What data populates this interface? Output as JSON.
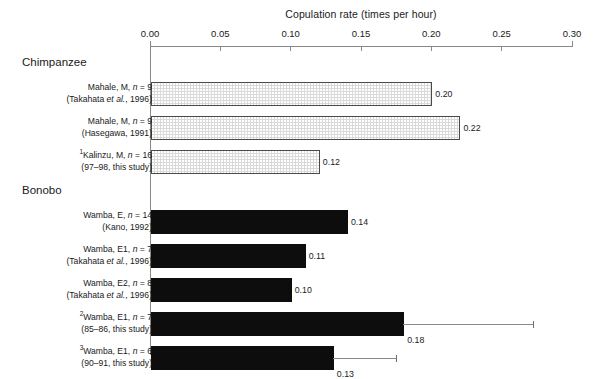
{
  "chart_data": {
    "type": "bar",
    "orientation": "horizontal",
    "title": "",
    "xlabel": "Copulation rate (times per hour)",
    "ylabel": "",
    "xlim": [
      0.0,
      0.3
    ],
    "xticks": [
      "0.00",
      "0.05",
      "0.10",
      "0.15",
      "0.20",
      "0.25",
      "0.30"
    ],
    "xtick_values": [
      0.0,
      0.05,
      0.1,
      0.15,
      0.2,
      0.25,
      0.3
    ],
    "grid": false,
    "legend": "none",
    "groups": [
      {
        "name": "Chimpanzee",
        "fill": "stippled-gray",
        "rows": [
          {
            "marker": "",
            "line1_pre": "Mahale, M, ",
            "line1_italic": "n",
            "line1_post": " = 9",
            "line2_pre": "(Takahata ",
            "line2_italic": "et al.",
            "line2_post": ", 1996)",
            "value": 0.2,
            "value_label": "0.20",
            "error_upper": null
          },
          {
            "marker": "",
            "line1_pre": "Mahale, M, ",
            "line1_italic": "n",
            "line1_post": " = 9",
            "line2_pre": "(Hasegawa, 1991)",
            "line2_italic": "",
            "line2_post": "",
            "value": 0.22,
            "value_label": "0.22",
            "error_upper": null
          },
          {
            "marker": "1",
            "line1_pre": "Kalinzu, M, ",
            "line1_italic": "n",
            "line1_post": " = 16",
            "line2_pre": "(97–98, this study)",
            "line2_italic": "",
            "line2_post": "",
            "value": 0.12,
            "value_label": "0.12",
            "error_upper": null
          }
        ]
      },
      {
        "name": "Bonobo",
        "fill": "solid-black",
        "rows": [
          {
            "marker": "",
            "line1_pre": "Wamba, E, ",
            "line1_italic": "n",
            "line1_post": " = 14",
            "line2_pre": "(Kano, 1992)",
            "line2_italic": "",
            "line2_post": "",
            "value": 0.14,
            "value_label": "0.14",
            "error_upper": null
          },
          {
            "marker": "",
            "line1_pre": "Wamba, E1, ",
            "line1_italic": "n",
            "line1_post": " = 7",
            "line2_pre": "(Takahata ",
            "line2_italic": "et al.",
            "line2_post": ", 1996)",
            "value": 0.11,
            "value_label": "0.11",
            "error_upper": null
          },
          {
            "marker": "",
            "line1_pre": "Wamba, E2, ",
            "line1_italic": "n",
            "line1_post": " = 8",
            "line2_pre": "(Takahata ",
            "line2_italic": "et al.",
            "line2_post": ", 1996)",
            "value": 0.1,
            "value_label": "0.10",
            "error_upper": null
          },
          {
            "marker": "2",
            "line1_pre": "Wamba, E1, ",
            "line1_italic": "n",
            "line1_post": " = 7",
            "line2_pre": "(85–86, this study)",
            "line2_italic": "",
            "line2_post": "",
            "value": 0.18,
            "value_label": "0.18",
            "error_upper": 0.272
          },
          {
            "marker": "3",
            "line1_pre": "Wamba, E1, ",
            "line1_italic": "n",
            "line1_post": " = 6",
            "line2_pre": "(90–91, this study)",
            "line2_italic": "",
            "line2_post": "",
            "value": 0.13,
            "value_label": "0.13",
            "error_upper": 0.175
          }
        ]
      }
    ],
    "colors": {
      "chimp_bar_fill": "#d9d9d9",
      "chimp_bar_stroke": "#4a4a4a",
      "bonobo_bar_fill": "#0d0d0d",
      "axis": "#8a8a8a",
      "text": "#1a1a1a"
    }
  }
}
